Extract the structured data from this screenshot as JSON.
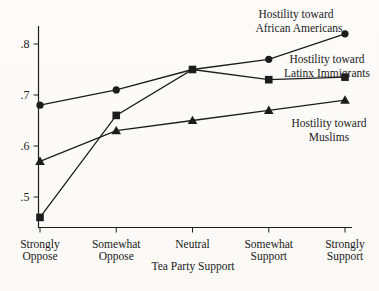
{
  "page": {
    "background": "#fbfaf7",
    "ink": "#1c1c1c"
  },
  "chart_data": {
    "type": "line",
    "title": "",
    "xlabel": "Tea Party Support",
    "ylabel": "",
    "x_categories": [
      [
        "Strongly",
        "Oppose"
      ],
      [
        "Somewhat",
        "Oppose"
      ],
      [
        "Neutral"
      ],
      [
        "Somewhat",
        "Support"
      ],
      [
        "Strongly",
        "Support"
      ]
    ],
    "y_ticks": [
      {
        "value": 0.5,
        "label": ".5"
      },
      {
        "value": 0.6,
        "label": ".6"
      },
      {
        "value": 0.7,
        "label": ".7"
      },
      {
        "value": 0.8,
        "label": ".8"
      }
    ],
    "ylim": [
      0.44,
      0.84
    ],
    "grid": false,
    "legend_position": "inline annotations beside lines",
    "series": [
      {
        "name": "Hostility toward African Americans",
        "label_lines": [
          "Hostility toward",
          "African Americans"
        ],
        "marker": "circle",
        "values": [
          0.68,
          0.71,
          0.75,
          0.77,
          0.82
        ]
      },
      {
        "name": "Hostility toward Latinx Immigrants",
        "label_lines": [
          "Hostility toward",
          "Latinx Immigrants"
        ],
        "marker": "square",
        "values": [
          0.46,
          0.66,
          0.75,
          0.73,
          0.735
        ]
      },
      {
        "name": "Hostility toward Muslims",
        "label_lines": [
          "Hostility toward",
          "Muslims"
        ],
        "marker": "triangle",
        "values": [
          0.57,
          0.63,
          0.65,
          0.67,
          0.69
        ]
      }
    ]
  }
}
